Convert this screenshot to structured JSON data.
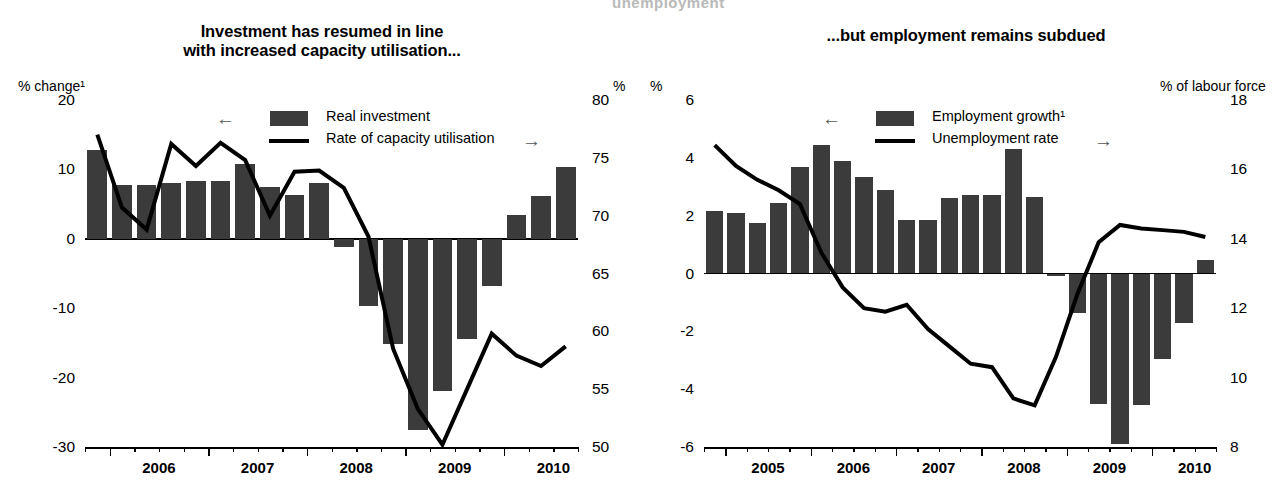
{
  "ghost_header_text": "unemployment",
  "panels": [
    {
      "id": "investment",
      "title_line1": "Investment has resumed in line",
      "title_line2": "with increased capacity utilisation...",
      "unit_left": "% change¹",
      "unit_right": "%",
      "legend": {
        "arrow_left": "←",
        "arrow_right": "→",
        "bar_label": "Real investment",
        "line_label": "Rate of capacity utilisation"
      }
    },
    {
      "id": "employment",
      "title_line1": "...but employment remains subdued",
      "title_line2": "",
      "unit_left": "%",
      "unit_right": "% of labour force",
      "legend": {
        "arrow_left": "←",
        "arrow_right": "→",
        "bar_label": "Employment growth¹",
        "line_label": "Unemployment rate"
      }
    }
  ],
  "chart_data": [
    {
      "type": "bar",
      "id": "investment",
      "title": "Investment has resumed in line with increased capacity utilisation...",
      "xlabel": "",
      "ylabel": "% change¹",
      "ylabel_right": "%",
      "ylim": [
        -30,
        20
      ],
      "ylim_right": [
        50,
        80
      ],
      "yticks": [
        20,
        10,
        0,
        -10,
        -20,
        -30
      ],
      "yticks_right": [
        80,
        75,
        70,
        65,
        60,
        55,
        50
      ],
      "xtick_labels": [
        "2006",
        "2007",
        "2008",
        "2009",
        "2010"
      ],
      "grid": false,
      "legend_position": "top-center",
      "x": [
        "2005Q4",
        "2006Q1",
        "2006Q2",
        "2006Q3",
        "2006Q4",
        "2007Q1",
        "2007Q2",
        "2007Q3",
        "2007Q4",
        "2008Q1",
        "2008Q2",
        "2008Q3",
        "2008Q4",
        "2009Q1",
        "2009Q2",
        "2009Q3",
        "2009Q4",
        "2010Q1",
        "2010Q2",
        "2010Q3"
      ],
      "series": [
        {
          "name": "Real investment",
          "axis": "left",
          "kind": "bar",
          "values": [
            12.8,
            7.8,
            7.8,
            8.0,
            8.4,
            8.4,
            10.8,
            7.5,
            6.3,
            8.0,
            -1.2,
            -9.7,
            -15.2,
            -27.5,
            -22.0,
            -14.5,
            -6.8,
            3.5,
            6.2,
            10.4
          ]
        },
        {
          "name": "Rate of capacity utilisation",
          "axis": "right",
          "kind": "line",
          "values": [
            77.0,
            70.7,
            68.8,
            76.2,
            74.3,
            76.3,
            74.8,
            70.0,
            73.8,
            73.9,
            72.4,
            68.2,
            58.5,
            53.3,
            50.2,
            55.0,
            59.8,
            57.9,
            57.0,
            58.7
          ]
        }
      ]
    },
    {
      "type": "bar",
      "id": "employment",
      "title": "...but employment remains subdued",
      "xlabel": "",
      "ylabel": "%",
      "ylabel_right": "% of labour force",
      "ylim": [
        -6,
        6
      ],
      "ylim_right": [
        8,
        18
      ],
      "yticks": [
        6,
        4,
        2,
        0,
        -2,
        -4,
        -6
      ],
      "yticks_right": [
        18,
        16,
        14,
        12,
        10,
        8
      ],
      "xtick_labels": [
        "2005",
        "2006",
        "2007",
        "2008",
        "2009",
        "2010"
      ],
      "grid": false,
      "legend_position": "top-center",
      "x": [
        "2004Q4",
        "2005Q1",
        "2005Q2",
        "2005Q3",
        "2005Q4",
        "2006Q1",
        "2006Q2",
        "2006Q3",
        "2006Q4",
        "2007Q1",
        "2007Q2",
        "2007Q3",
        "2007Q4",
        "2008Q1",
        "2008Q2",
        "2008Q3",
        "2008Q4",
        "2009Q1",
        "2009Q2",
        "2009Q3",
        "2009Q4",
        "2010Q1",
        "2010Q2",
        "2010Q3"
      ],
      "series": [
        {
          "name": "Employment growth¹",
          "axis": "left",
          "kind": "bar",
          "values": [
            2.15,
            2.1,
            1.75,
            2.45,
            3.7,
            4.45,
            3.9,
            3.35,
            2.9,
            1.85,
            1.85,
            2.6,
            2.7,
            2.7,
            4.3,
            2.65,
            -0.1,
            -1.35,
            -4.5,
            -5.9,
            -4.55,
            -2.95,
            -1.7,
            0.45
          ]
        },
        {
          "name": "Unemployment rate",
          "axis": "right",
          "kind": "line",
          "values": [
            16.7,
            16.1,
            15.7,
            15.4,
            15.0,
            13.6,
            12.6,
            12.0,
            11.9,
            12.1,
            11.4,
            10.9,
            10.4,
            10.3,
            9.4,
            9.2,
            10.6,
            12.4,
            13.9,
            14.4,
            14.3,
            14.25,
            14.2,
            14.05
          ]
        }
      ]
    }
  ]
}
